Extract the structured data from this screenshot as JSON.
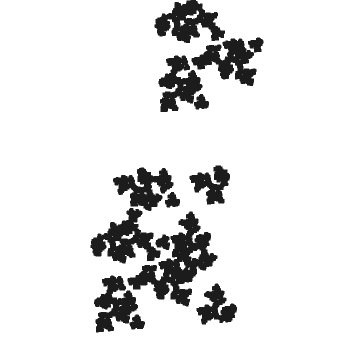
{
  "figure": {
    "title": "Pentadendrite fractal",
    "width": 342,
    "height": 343,
    "background_color": "#ffffff",
    "ink_color": "#1c1c1c",
    "symmetry": "5-fold rotational (pinwheel)",
    "arm_count": 5,
    "render_mode": "ifs-chaos-game"
  },
  "chart_data": {
    "type": "scatter",
    "title": "Pentadendrite fractal",
    "xlabel": "",
    "ylabel": "",
    "grid": false,
    "legend": null,
    "xlim": [
      -1.0,
      1.0
    ],
    "ylim": [
      -1.0,
      1.0
    ],
    "point_color": "#1c1c1c",
    "point_size": 0.85,
    "iterations": 900000,
    "skip_iterations": 30,
    "fractal_dimension": 1.8617,
    "ifs": {
      "name": "pentadendrite",
      "scale": 0.3333333333,
      "maps": [
        {
          "r": 0.3333333333,
          "theta_deg": 0.0,
          "tx": 0.0,
          "ty": 0.0,
          "p": 0.1667
        },
        {
          "r": 0.3333333333,
          "theta_deg": 72.0,
          "tx": 0.3333333333,
          "ty": 0.0,
          "p": 0.1667
        },
        {
          "r": 0.3333333333,
          "theta_deg": 216.0,
          "tx": 0.4363389981,
          "ty": 0.3129731215,
          "p": 0.1667
        },
        {
          "r": 0.3333333333,
          "theta_deg": 288.0,
          "tx": 0.2060113296,
          "ty": 0.5019206076,
          "p": 0.1667
        },
        {
          "r": 0.3333333333,
          "theta_deg": 0.0,
          "tx": 0.4363389981,
          "ty": 0.6908680938,
          "p": 0.1667
        },
        {
          "r": 0.3333333333,
          "theta_deg": 72.0,
          "tx": 0.7696723314,
          "ty": 0.6908680938,
          "p": 0.1665
        }
      ]
    },
    "bounding_box_px": {
      "x_min": 18,
      "y_min": 10,
      "x_max": 332,
      "y_max": 330
    },
    "center_px": {
      "x": 175,
      "y": 170
    },
    "arms_px": [
      {
        "label": "upper-left-arm",
        "angle_deg": 118,
        "tip_x": 112,
        "tip_y": 24
      },
      {
        "label": "upper-right-arm",
        "angle_deg": 34,
        "tip_x": 297,
        "tip_y": 96
      },
      {
        "label": "right-arm",
        "angle_deg": -8,
        "tip_x": 331,
        "tip_y": 152
      },
      {
        "label": "lower-right-arm",
        "angle_deg": -74,
        "tip_x": 222,
        "tip_y": 328
      },
      {
        "label": "left-arm",
        "angle_deg": 186,
        "tip_x": 19,
        "tip_y": 204
      }
    ]
  }
}
